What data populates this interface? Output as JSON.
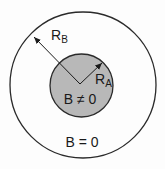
{
  "diagram": {
    "outer_region": {
      "label": "B = 0",
      "radius_label": "R",
      "radius_subscript": "B",
      "fill": "#fdfdfd",
      "stroke": "#2a2a2a"
    },
    "inner_region": {
      "label": "B ≠ 0",
      "radius_label": "R",
      "radius_subscript": "A",
      "fill": "#b8b8b8",
      "stroke": "#2a2a2a"
    }
  }
}
